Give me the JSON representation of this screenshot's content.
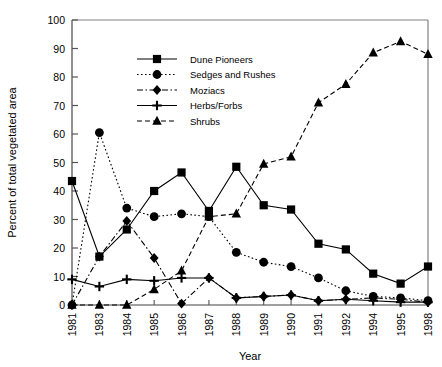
{
  "chart_data": {
    "type": "line",
    "title": "",
    "xlabel": "Year",
    "ylabel": "Percent of total vegetated area",
    "categories": [
      "1981",
      "1983",
      "1984",
      "1985",
      "1986",
      "1987",
      "1988",
      "1989",
      "1990",
      "1991",
      "1992",
      "1994",
      "1995",
      "1998"
    ],
    "ylim": [
      0,
      100
    ],
    "yticks": [
      0,
      10,
      20,
      30,
      40,
      50,
      60,
      70,
      80,
      90,
      100
    ],
    "grid": false,
    "legend_position": "upper-left-inside",
    "series": [
      {
        "name": "Dune Pioneers",
        "marker": "square",
        "line": "solid",
        "color": "#000000",
        "values": [
          43.5,
          17.0,
          26.5,
          40.0,
          46.5,
          33.0,
          48.5,
          35.0,
          33.5,
          21.5,
          19.5,
          11.0,
          7.5,
          13.5
        ]
      },
      {
        "name": "Sedges and Rushes",
        "marker": "circle",
        "line": "dotted",
        "color": "#000000",
        "values": [
          0.0,
          60.5,
          34.0,
          31.0,
          32.0,
          31.0,
          18.5,
          15.0,
          13.5,
          9.5,
          5.0,
          3.0,
          2.5,
          1.5
        ]
      },
      {
        "name": "Moziacs",
        "marker": "diamond",
        "line": "dash-dot",
        "color": "#000000",
        "values": [
          0.0,
          17.0,
          29.5,
          16.5,
          0.5,
          9.5,
          2.5,
          3.0,
          3.5,
          1.5,
          2.0,
          2.5,
          2.0,
          1.0
        ]
      },
      {
        "name": "Herbs/Forbs",
        "marker": "plus",
        "line": "solid",
        "color": "#000000",
        "values": [
          9.0,
          6.5,
          9.0,
          8.5,
          9.5,
          9.5,
          2.5,
          3.0,
          3.5,
          1.5,
          2.0,
          1.5,
          1.0,
          1.0
        ]
      },
      {
        "name": "Shrubs",
        "marker": "triangle",
        "line": "dashed",
        "color": "#000000",
        "values": [
          0.0,
          0.0,
          0.0,
          5.5,
          12.0,
          31.0,
          32.0,
          49.5,
          52.0,
          71.0,
          77.5,
          88.5,
          92.5,
          88.0
        ]
      }
    ]
  },
  "legend": {
    "items": [
      {
        "label": "Dune Pioneers"
      },
      {
        "label": "Sedges and Rushes"
      },
      {
        "label": "Moziacs"
      },
      {
        "label": "Herbs/Forbs"
      },
      {
        "label": "Shrubs"
      }
    ]
  }
}
